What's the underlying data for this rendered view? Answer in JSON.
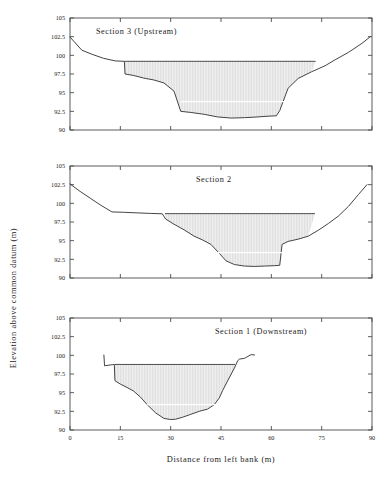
{
  "figure": {
    "ylabel": "Elevation above common datum (m)",
    "xlabel": "Distance from left bank (m)",
    "yticks": [
      "105",
      "102.5",
      "100",
      "97.5",
      "95",
      "92.5",
      "90"
    ],
    "xticks": [
      "0",
      "15",
      "30",
      "45",
      "60",
      "75",
      "90"
    ],
    "ylim": [
      90,
      105
    ],
    "xlim": [
      0,
      90
    ],
    "fill_color": "#e8e8e8",
    "line_color": "#3a3a3a"
  },
  "chart_data": [
    {
      "type": "line",
      "title": "Section 3 (Upstream)",
      "xlabel": "Distance from left bank (m)",
      "ylabel": "Elevation above common datum (m)",
      "xlim": [
        0,
        90
      ],
      "ylim": [
        90,
        105
      ],
      "grid": false,
      "legend": "none",
      "series": [
        {
          "name": "bed profile",
          "x": [
            0,
            3.5,
            6.5,
            10,
            13.5,
            16.2,
            16.4,
            19,
            22,
            25,
            28,
            31,
            33,
            36,
            40,
            44,
            48,
            52,
            56,
            59,
            61.5,
            62.5,
            65,
            68,
            72,
            76,
            79,
            83,
            87,
            89.5
          ],
          "y": [
            102.45,
            100.7,
            100.15,
            99.6,
            99.25,
            99.2,
            97.5,
            97.3,
            96.95,
            96.7,
            96.3,
            95.2,
            92.5,
            92.35,
            92.1,
            91.75,
            91.6,
            91.65,
            91.75,
            91.85,
            91.9,
            92.6,
            95.6,
            96.9,
            97.8,
            98.6,
            99.4,
            100.4,
            101.6,
            102.5
          ]
        },
        {
          "name": "water surface",
          "x": [
            16.3,
            73.2
          ],
          "y": [
            99.2,
            99.2
          ]
        },
        {
          "name": "sub-surface marker",
          "x": [
            33,
            65
          ],
          "y": [
            93.8,
            93.8
          ]
        }
      ]
    },
    {
      "type": "line",
      "title": "Section 2",
      "xlabel": "Distance from left bank (m)",
      "ylabel": "Elevation above common datum (m)",
      "xlim": [
        0,
        90
      ],
      "ylim": [
        90,
        105
      ],
      "grid": false,
      "legend": "none",
      "series": [
        {
          "name": "bed profile",
          "x": [
            0,
            3,
            6,
            9,
            12.5,
            16,
            20,
            24,
            27.5,
            28.5,
            31,
            34,
            37,
            39.5,
            42,
            44.5,
            46.5,
            49,
            52,
            55,
            58,
            61,
            62.5,
            63.2,
            65,
            68,
            71,
            74,
            77,
            80,
            83,
            86,
            88.5
          ],
          "y": [
            102.6,
            101.6,
            100.7,
            99.8,
            98.85,
            98.8,
            98.72,
            98.65,
            98.6,
            97.9,
            97.2,
            96.45,
            95.6,
            95.1,
            94.5,
            93.3,
            92.3,
            91.8,
            91.6,
            91.55,
            91.6,
            91.65,
            91.7,
            94.5,
            94.9,
            95.2,
            95.6,
            96.4,
            97.3,
            98.3,
            99.6,
            101.2,
            102.5
          ]
        },
        {
          "name": "water surface",
          "x": [
            28.3,
            73.0
          ],
          "y": [
            98.62,
            98.62
          ]
        },
        {
          "name": "sub-surface marker",
          "x": [
            42,
            64
          ],
          "y": [
            93.4,
            93.4
          ]
        }
      ]
    },
    {
      "type": "line",
      "title": "Section 1 (Downstream)",
      "xlabel": "Distance from left bank (m)",
      "ylabel": "Elevation above common datum (m)",
      "xlim": [
        0,
        90
      ],
      "ylim": [
        90,
        105
      ],
      "grid": false,
      "legend": "none",
      "series": [
        {
          "name": "bed profile",
          "x": [
            10.1,
            10.3,
            12.6,
            13.2,
            13.4,
            15,
            17,
            19,
            21,
            23,
            25.5,
            28,
            30,
            31.5,
            33.5,
            36,
            38.5,
            41,
            43,
            44.5,
            45.5,
            47,
            49,
            50,
            50.5,
            52,
            54,
            55
          ],
          "y": [
            100.05,
            98.6,
            98.75,
            98.78,
            96.6,
            96.15,
            95.7,
            95.2,
            94.4,
            93.4,
            92.3,
            91.55,
            91.4,
            91.45,
            91.7,
            92.1,
            92.5,
            92.8,
            93.4,
            94.3,
            95.3,
            96.6,
            98.3,
            99.3,
            99.5,
            99.6,
            100.1,
            100.05
          ]
        },
        {
          "name": "water surface",
          "x": [
            13.3,
            49.2
          ],
          "y": [
            98.78,
            98.78
          ]
        },
        {
          "name": "sub-surface marker",
          "x": [
            23,
            45
          ],
          "y": [
            93.4,
            93.4
          ]
        }
      ]
    }
  ]
}
